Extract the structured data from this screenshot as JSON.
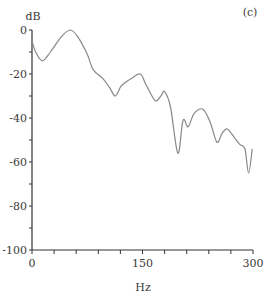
{
  "chart_data": {
    "type": "line",
    "title": "",
    "panel_label": "(c)",
    "xlabel": "Hz",
    "ylabel": "dB",
    "xlim": [
      0,
      300
    ],
    "ylim": [
      -100,
      0
    ],
    "x_ticks_labeled": [
      0,
      150,
      300
    ],
    "x_ticks_minor_step": 30,
    "y_ticks_labeled": [
      0,
      -20,
      -40,
      -60,
      -80,
      -100
    ],
    "y_ticks_minor_step": 10,
    "grid": false,
    "legend": null,
    "series": [
      {
        "name": "response",
        "color": "#888888",
        "x": [
          0,
          5,
          14,
          25,
          40,
          52,
          62,
          75,
          83,
          96,
          105,
          113,
          120,
          126,
          135,
          147,
          155,
          167,
          175,
          180,
          188,
          198,
          205,
          212,
          220,
          232,
          242,
          251,
          258,
          265,
          275,
          282,
          289,
          294,
          299
        ],
        "y": [
          -5,
          -10,
          -14,
          -10,
          -3,
          0,
          -3,
          -11,
          -18,
          -22,
          -26,
          -30,
          -26,
          -24,
          -22,
          -20,
          -25,
          -32,
          -30,
          -28,
          -35,
          -56,
          -41,
          -44,
          -38,
          -36,
          -42,
          -51,
          -47,
          -45,
          -49,
          -52,
          -54,
          -65,
          -54
        ]
      }
    ]
  }
}
